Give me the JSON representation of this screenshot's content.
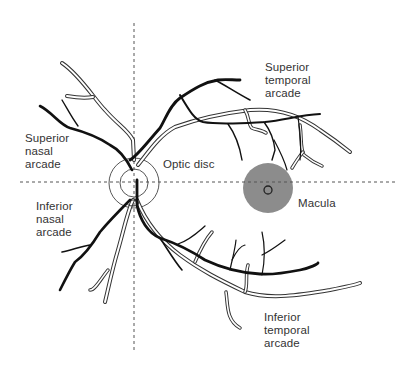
{
  "figure": {
    "labels": {
      "superior_temporal_arcade": "Superior\ntemporal\narcade",
      "superior_nasal_arcade": "Superior\nnasal\narcade",
      "optic_disc": "Optic disc",
      "inferior_nasal_arcade": "Inferior\nnasal\narcade",
      "macula": "Macula",
      "inferior_temporal_arcade": "Inferior\ntemporal\narcade"
    },
    "colors": {
      "background": "#ffffff",
      "artery": "#111111",
      "vein_outline": "#333333",
      "macula_fill": "#8c8c8c",
      "axis_lines": "#555555",
      "text": "#333333"
    },
    "structures": {
      "optic_disc": {
        "cx": 134,
        "cy": 183,
        "inner_r": 14,
        "outer_r": 25
      },
      "macula": {
        "cx": 268,
        "cy": 188,
        "r": 25,
        "fovea_r": 4
      },
      "vertical_axis": {
        "x": 134,
        "y1": 23,
        "y2": 352
      },
      "horizontal_axis": {
        "y": 182,
        "x1": 20,
        "x2": 395
      }
    }
  }
}
